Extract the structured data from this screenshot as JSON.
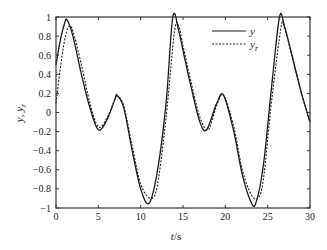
{
  "chart_data": {
    "type": "line",
    "title": "",
    "xlabel": "t/s",
    "ylabel": "y, y_r",
    "xlim": [
      0,
      30
    ],
    "ylim": [
      -1,
      1
    ],
    "xticks": [
      0,
      5,
      10,
      15,
      20,
      25,
      30
    ],
    "yticks": [
      -1,
      -0.8,
      -0.6,
      -0.4,
      -0.2,
      0,
      0.2,
      0.4,
      0.6,
      0.8,
      1
    ],
    "ytick_labels": [
      "−1",
      "−0.8",
      "−0.6",
      "−0.4",
      "−0.2",
      "0",
      "0.2",
      "0.4",
      "0.6",
      "0.8",
      "1"
    ],
    "grid": false,
    "legend_position": "upper right",
    "series": [
      {
        "name": "y",
        "style": "solid",
        "x": [
          0,
          0.5,
          1,
          1.3,
          2,
          3,
          4,
          5,
          6,
          7,
          7.2,
          8,
          9,
          10,
          11,
          12,
          13,
          13.8,
          14.5,
          15,
          16,
          17,
          17.8,
          19,
          19.8,
          21,
          22,
          23,
          23.6,
          24.5,
          25.5,
          26.4,
          27,
          28,
          29,
          30
        ],
        "values": [
          0.5,
          0.75,
          0.93,
          0.97,
          0.8,
          0.4,
          0.05,
          -0.18,
          -0.08,
          0.15,
          0.18,
          0.05,
          -0.4,
          -0.8,
          -0.95,
          -0.6,
          0.1,
          1.0,
          0.85,
          0.65,
          0.25,
          -0.1,
          -0.18,
          0.1,
          0.18,
          -0.2,
          -0.65,
          -0.93,
          -0.95,
          -0.55,
          0.3,
          1.0,
          0.9,
          0.55,
          0.2,
          -0.1
        ]
      },
      {
        "name": "y_r",
        "style": "dashed",
        "x": [
          0,
          0.5,
          1,
          1.5,
          2,
          3,
          4,
          5,
          6,
          7,
          7.2,
          8,
          9,
          10,
          11.2,
          12,
          13,
          14,
          14.5,
          15,
          16,
          17,
          18,
          19,
          19.8,
          21,
          22,
          23,
          23.8,
          24.5,
          25.5,
          26.6,
          27,
          28,
          29,
          30
        ],
        "values": [
          0.1,
          0.45,
          0.75,
          0.9,
          0.85,
          0.5,
          0.1,
          -0.15,
          -0.06,
          0.15,
          0.18,
          0.07,
          -0.35,
          -0.75,
          -0.9,
          -0.75,
          -0.05,
          0.85,
          0.9,
          0.7,
          0.3,
          -0.05,
          -0.18,
          0.08,
          0.18,
          -0.15,
          -0.6,
          -0.85,
          -0.9,
          -0.7,
          0.15,
          0.9,
          0.88,
          0.55,
          0.2,
          -0.1
        ]
      }
    ]
  },
  "legend": {
    "items": [
      {
        "label": "y",
        "style": "solid"
      },
      {
        "label": "y",
        "sub": "r",
        "style": "dashed"
      }
    ]
  },
  "axes": {
    "xlabel_italic": "t",
    "xlabel_rest": "/s",
    "ylabel_parts": [
      "y",
      ", ",
      "y",
      "r"
    ]
  },
  "colors": {
    "line": "#1a1a1a",
    "frame": "#333333",
    "background": "#ffffff"
  }
}
